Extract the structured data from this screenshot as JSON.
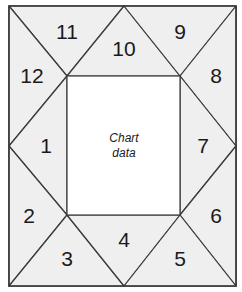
{
  "diagram": {
    "type": "astrological-chart-north-indian-variant",
    "colors": {
      "cell_fill": "#efefef",
      "center_fill": "#ffffff",
      "line": "#3a3a3a"
    },
    "center": {
      "line1": "Chart",
      "line2": "data"
    },
    "houses": [
      {
        "num": "1",
        "x": 46,
        "y": 146
      },
      {
        "num": "2",
        "x": 29,
        "y": 217
      },
      {
        "num": "3",
        "x": 67,
        "y": 259
      },
      {
        "num": "4",
        "x": 124,
        "y": 240
      },
      {
        "num": "5",
        "x": 180,
        "y": 259
      },
      {
        "num": "6",
        "x": 216,
        "y": 217
      },
      {
        "num": "7",
        "x": 203,
        "y": 146
      },
      {
        "num": "8",
        "x": 216,
        "y": 76
      },
      {
        "num": "9",
        "x": 180,
        "y": 33
      },
      {
        "num": "10",
        "x": 124,
        "y": 49
      },
      {
        "num": "11",
        "x": 67,
        "y": 33
      },
      {
        "num": "12",
        "x": 32,
        "y": 76
      }
    ]
  }
}
